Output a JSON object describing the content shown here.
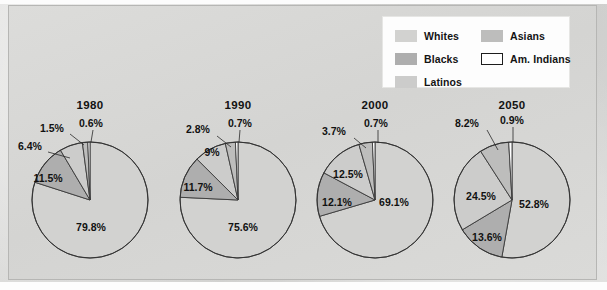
{
  "figure": {
    "background_color": "#d6d6d4",
    "plate_color": "#d8d8d6"
  },
  "legend": {
    "items": [
      {
        "label": "Whites",
        "color": "#d2d2d0",
        "bordered": false,
        "column": "a"
      },
      {
        "label": "Blacks",
        "color": "#aeaeae",
        "bordered": false,
        "column": "a"
      },
      {
        "label": "Latinos",
        "color": "#cccccb",
        "bordered": false,
        "column": "a"
      },
      {
        "label": "Asians",
        "color": "#bdbdbc",
        "bordered": false,
        "column": "b"
      },
      {
        "label": "Am. Indians",
        "color": "#ffffff",
        "bordered": true,
        "column": "b"
      }
    ]
  },
  "chart_data": {
    "type": "pie",
    "title": "",
    "legend_position": "top-right",
    "grid": false,
    "series_names": [
      "Whites",
      "Blacks",
      "Latinos",
      "Asians",
      "Am. Indians"
    ],
    "slice_colors": [
      "#d2d2d0",
      "#aeaeae",
      "#cccccb",
      "#bdbdbc",
      "#ffffff"
    ],
    "charts": [
      {
        "title": "1980",
        "labels": [
          "Whites",
          "Blacks",
          "Latinos",
          "Asians",
          "Am. Indians"
        ],
        "values": [
          79.8,
          11.5,
          6.4,
          1.5,
          0.6
        ],
        "value_labels": [
          "79.8%",
          "11.5%",
          "6.4%",
          "1.5%",
          "0.6%"
        ]
      },
      {
        "title": "1990",
        "labels": [
          "Whites",
          "Blacks",
          "Latinos",
          "Asians",
          "Am. Indians"
        ],
        "values": [
          75.6,
          11.7,
          9.0,
          2.8,
          0.7
        ],
        "value_labels": [
          "75.6%",
          "11.7%",
          "9%",
          "2.8%",
          "0.7%"
        ]
      },
      {
        "title": "2000",
        "labels": [
          "Whites",
          "Blacks",
          "Latinos",
          "Asians",
          "Am. Indians"
        ],
        "values": [
          69.1,
          12.1,
          12.5,
          3.7,
          0.7
        ],
        "value_labels": [
          "69.1%",
          "12.1%",
          "12.5%",
          "3.7%",
          "0.7%"
        ]
      },
      {
        "title": "2050",
        "labels": [
          "Whites",
          "Blacks",
          "Latinos",
          "Asians",
          "Am. Indians"
        ],
        "values": [
          52.8,
          13.6,
          24.5,
          8.2,
          0.9
        ],
        "value_labels": [
          "52.8%",
          "13.6%",
          "24.5%",
          "8.2%",
          "0.9%"
        ]
      }
    ]
  },
  "layout": {
    "pies": [
      {
        "cx": 90,
        "cy": 200,
        "r": 58
      },
      {
        "cx": 238,
        "cy": 200,
        "r": 58
      },
      {
        "cx": 375,
        "cy": 200,
        "r": 58
      },
      {
        "cx": 512,
        "cy": 200,
        "r": 58
      }
    ],
    "year_label_y": 99,
    "label_placements": [
      [
        {
          "t": "79.8%",
          "x": 91,
          "y": 228,
          "anchor": "middle",
          "leader": null
        },
        {
          "t": "11.5%",
          "x": 48,
          "y": 179,
          "anchor": "middle",
          "leader": null
        },
        {
          "t": "6.4%",
          "x": 18,
          "y": 147,
          "anchor": "start",
          "leader": [
            [
              48,
              152
            ],
            [
              70,
              158
            ]
          ]
        },
        {
          "t": "1.5%",
          "x": 40,
          "y": 129,
          "anchor": "start",
          "leader": [
            [
              70,
              134
            ],
            [
              84,
              145
            ]
          ]
        },
        {
          "t": "0.6%",
          "x": 79,
          "y": 124,
          "anchor": "start",
          "leader": [
            [
              93,
              130
            ],
            [
              91,
              142
            ]
          ]
        }
      ],
      [
        {
          "t": "75.6%",
          "x": 243,
          "y": 228,
          "anchor": "middle",
          "leader": null
        },
        {
          "t": "11.7%",
          "x": 198,
          "y": 188,
          "anchor": "middle",
          "leader": null
        },
        {
          "t": "9%",
          "x": 212,
          "y": 153,
          "anchor": "middle",
          "leader": null
        },
        {
          "t": "2.8%",
          "x": 186,
          "y": 130,
          "anchor": "start",
          "leader": [
            [
              217,
              136
            ],
            [
              231,
              147
            ]
          ]
        },
        {
          "t": "0.7%",
          "x": 228,
          "y": 124,
          "anchor": "start",
          "leader": [
            [
              240,
              130
            ],
            [
              239,
              142
            ]
          ]
        }
      ],
      [
        {
          "t": "69.1%",
          "x": 394,
          "y": 203,
          "anchor": "middle",
          "leader": null
        },
        {
          "t": "12.1%",
          "x": 337,
          "y": 203,
          "anchor": "middle",
          "leader": null
        },
        {
          "t": "12.5%",
          "x": 348,
          "y": 175,
          "anchor": "middle",
          "leader": null
        },
        {
          "t": "3.7%",
          "x": 322,
          "y": 132,
          "anchor": "start",
          "leader": [
            [
              354,
              138
            ],
            [
              366,
              148
            ]
          ]
        },
        {
          "t": "0.7%",
          "x": 364,
          "y": 124,
          "anchor": "start",
          "leader": [
            [
              378,
              130
            ],
            [
              378,
              143
            ]
          ]
        }
      ],
      [
        {
          "t": "52.8%",
          "x": 534,
          "y": 205,
          "anchor": "middle",
          "leader": null
        },
        {
          "t": "13.6%",
          "x": 487,
          "y": 238,
          "anchor": "middle",
          "leader": null
        },
        {
          "t": "24.5%",
          "x": 481,
          "y": 197,
          "anchor": "middle",
          "leader": null
        },
        {
          "t": "8.2%",
          "x": 455,
          "y": 124,
          "anchor": "start",
          "leader": [
            [
              487,
              130
            ],
            [
              498,
              150
            ]
          ]
        },
        {
          "t": "0.9%",
          "x": 500,
          "y": 121,
          "anchor": "start",
          "leader": [
            [
              513,
              127
            ],
            [
              513,
              142
            ]
          ]
        }
      ]
    ]
  }
}
